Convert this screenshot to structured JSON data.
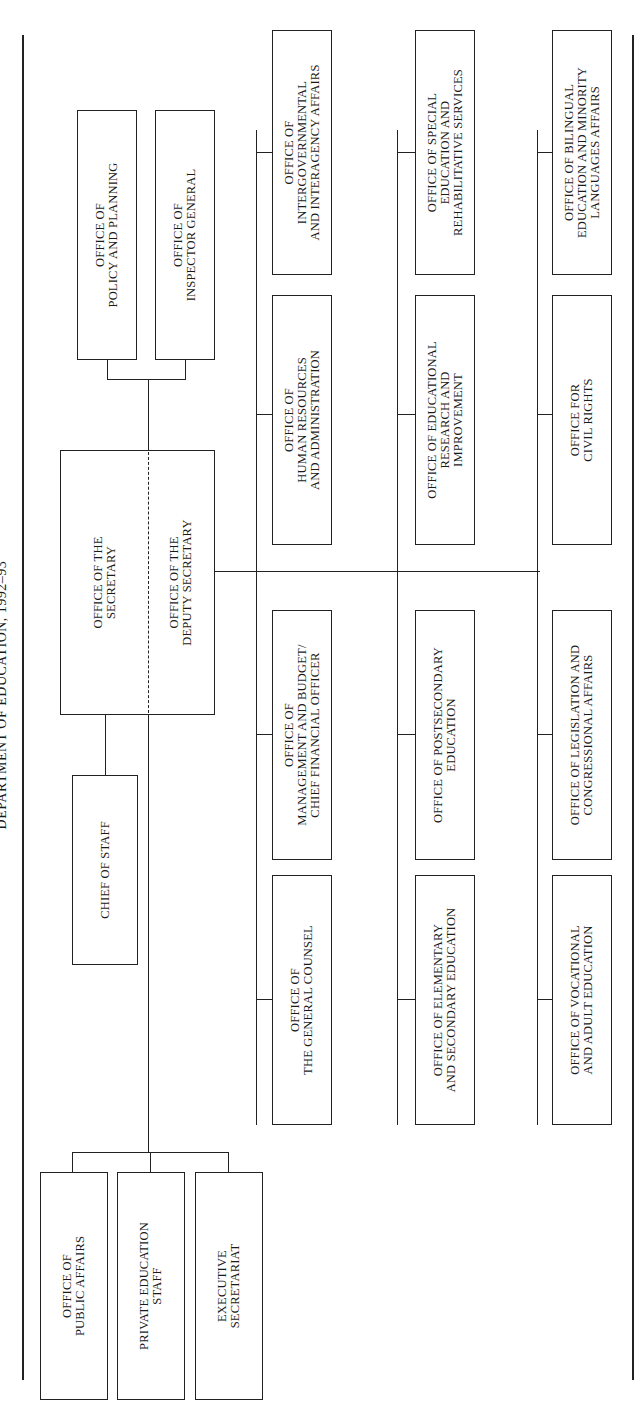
{
  "title": "DEPARTMENT OF EDUCATION, 1992–93",
  "secretary": {
    "top": [
      "OFFICE OF THE",
      "SECRETARY"
    ],
    "bottom": [
      "OFFICE OF THE",
      "DEPUTY SECRETARY"
    ]
  },
  "staff_offices": [
    {
      "lines": [
        "OFFICE OF",
        "POLICY AND PLANNING"
      ]
    },
    {
      "lines": [
        "OFFICE OF",
        "INSPECTOR GENERAL"
      ]
    }
  ],
  "chief_of_staff": {
    "lines": [
      "CHIEF OF STAFF"
    ]
  },
  "chief_of_staff_units": [
    {
      "lines": [
        "OFFICE OF",
        "PUBLIC AFFAIRS"
      ]
    },
    {
      "lines": [
        "PRIVATE EDUCATION",
        "STAFF"
      ]
    },
    {
      "lines": [
        "EXECUTIVE",
        "SECRETARIAT"
      ]
    }
  ],
  "columns": [
    {
      "offices": [
        {
          "lines": [
            "OFFICE OF",
            "INTERGOVERNMENTAL",
            "AND INTERAGENCY AFFAIRS"
          ]
        },
        {
          "lines": [
            "OFFICE OF",
            "HUMAN RESOURCES",
            "AND ADMINISTRATION"
          ]
        },
        {
          "lines": [
            "OFFICE OF",
            "MANAGEMENT AND BUDGET/",
            "CHIEF FINANCIAL OFFICER"
          ]
        },
        {
          "lines": [
            "OFFICE OF",
            "THE GENERAL COUNSEL"
          ]
        }
      ]
    },
    {
      "offices": [
        {
          "lines": [
            "OFFICE OF SPECIAL",
            "EDUCATION AND",
            "REHABILITATIVE SERVICES"
          ]
        },
        {
          "lines": [
            "OFFICE OF EDUCATIONAL",
            "RESEARCH AND",
            "IMPROVEMENT"
          ]
        },
        {
          "lines": [
            "OFFICE OF POSTSECONDARY",
            "EDUCATION"
          ]
        },
        {
          "lines": [
            "OFFICE OF ELEMENTARY",
            "AND SECONDARY EDUCATION"
          ]
        }
      ]
    },
    {
      "offices": [
        {
          "lines": [
            "OFFICE OF BILINGUAL",
            "EDUCATION AND MINORITY",
            "LANGUAGES AFFAIRS"
          ]
        },
        {
          "lines": [
            "OFFICE FOR",
            "CIVIL RIGHTS"
          ]
        },
        {
          "lines": [
            "OFFICE OF LEGISLATION AND",
            "CONGRESSIONAL AFFAIRS"
          ]
        },
        {
          "lines": [
            "OFFICE OF VOCATIONAL",
            "AND ADULT EDUCATION"
          ]
        }
      ]
    }
  ]
}
